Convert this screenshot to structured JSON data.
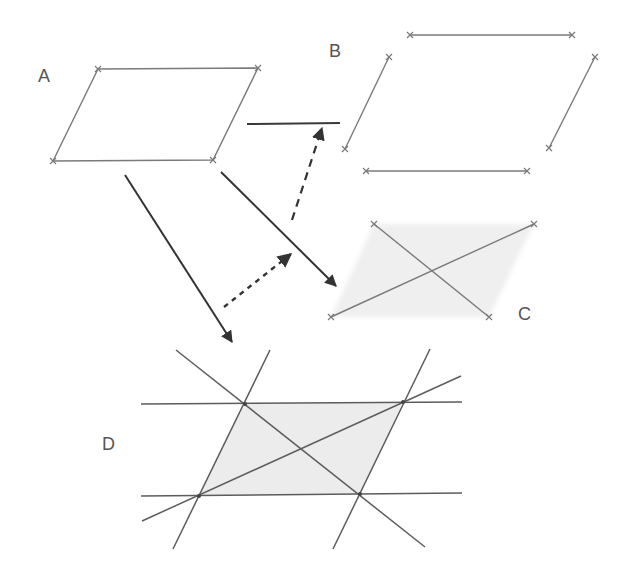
{
  "diagram": {
    "colors": {
      "fill": "#ececec",
      "fill_faint": "#f1f1f1",
      "edge": "#7a7a7a",
      "arrow": "#333333",
      "label": "#555555"
    },
    "panels": {
      "A": {
        "label": "A",
        "shape": "shaded parallelogram",
        "vertices": [
          [
            98,
            69
          ],
          [
            258,
            68
          ],
          [
            213,
            160
          ],
          [
            53,
            161
          ]
        ]
      },
      "B": {
        "label": "B",
        "shape": "four separate sides of parallelogram",
        "segments": [
          [
            [
              410,
              35
            ],
            [
              572,
              35
            ]
          ],
          [
            [
              389,
              57
            ],
            [
              345,
              149
            ]
          ],
          [
            [
              595,
              57
            ],
            [
              549,
              148
            ]
          ],
          [
            [
              366,
              171
            ],
            [
              527,
              171
            ]
          ]
        ]
      },
      "C": {
        "label": "C",
        "shape": "faint parallelogram with two diagonals",
        "vertices": [
          [
            374,
            224
          ],
          [
            534,
            224
          ],
          [
            489,
            317
          ],
          [
            331,
            317
          ]
        ],
        "diagonals": [
          [
            [
              374,
              224
            ],
            [
              489,
              317
            ]
          ],
          [
            [
              331,
              317
            ],
            [
              534,
              224
            ]
          ]
        ]
      },
      "D": {
        "label": "D",
        "shape": "parallelogram formed by extended lines with diagonals",
        "vertices": [
          [
            245,
            404
          ],
          [
            403,
            402
          ],
          [
            360,
            494
          ],
          [
            199,
            496
          ]
        ],
        "lines": [
          [
            [
              141,
              404
            ],
            [
              462,
              402
            ]
          ],
          [
            [
              141,
              496
            ],
            [
              462,
              493
            ]
          ],
          [
            [
              270,
              350
            ],
            [
              173,
              549
            ]
          ],
          [
            [
              430,
              349
            ],
            [
              333,
              549
            ]
          ],
          [
            [
              176,
              350
            ],
            [
              425,
              547
            ]
          ],
          [
            [
              142,
              521
            ],
            [
              461,
              376
            ]
          ]
        ]
      }
    },
    "arrows": [
      {
        "name": "A-to-D",
        "style": "solid",
        "from": [
          125,
          175
        ],
        "to": [
          232,
          342
        ]
      },
      {
        "name": "A-to-C",
        "style": "solid",
        "from": [
          221,
          172
        ],
        "to": [
          336,
          286
        ]
      },
      {
        "name": "dotted-step",
        "style": "dotted",
        "from": [
          224,
          307
        ],
        "to": [
          291,
          254
        ]
      },
      {
        "name": "dashed-step",
        "style": "dashed",
        "from": [
          292,
          220
        ],
        "to": [
          322,
          128
        ]
      }
    ],
    "side_bar": {
      "from": [
        247,
        124
      ],
      "to": [
        340,
        123
      ]
    }
  }
}
